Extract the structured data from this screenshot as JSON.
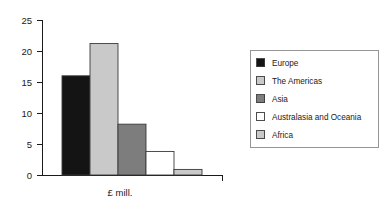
{
  "chart_data": {
    "type": "bar",
    "title": "",
    "subtitle": "",
    "xlabel": "£ mill.",
    "ylabel": "",
    "categories": [
      "Europe",
      "The Americas",
      "Asia",
      "Australasia and Oceania",
      "Africa"
    ],
    "values": [
      16,
      21.2,
      8.2,
      3.8,
      0.9
    ],
    "ylim": [
      0,
      25
    ],
    "yticks": [
      0,
      5,
      10,
      15,
      20,
      25
    ],
    "ytick_labels": [
      "0",
      "5",
      "10",
      "15",
      "20",
      "25"
    ],
    "grid": false,
    "legend_position": "right",
    "colors": [
      "#141414",
      "#c9c9c9",
      "#7d7d7d",
      "#ffffff",
      "#c9c9c9"
    ],
    "bar_edge_color": "#3a3a3a"
  },
  "legend": {
    "entries": [
      {
        "label": "Europe",
        "color": "#141414"
      },
      {
        "label": "The Americas",
        "color": "#c9c9c9"
      },
      {
        "label": "Asia",
        "color": "#7d7d7d"
      },
      {
        "label": "Australasia and Oceania",
        "color": "#ffffff"
      },
      {
        "label": "Africa",
        "color": "#c9c9c9"
      }
    ]
  },
  "axes": {
    "y_tick_0": "0",
    "y_tick_1": "5",
    "y_tick_2": "10",
    "y_tick_3": "15",
    "y_tick_4": "20",
    "y_tick_5": "25",
    "x_axis_title": "£ mill."
  }
}
